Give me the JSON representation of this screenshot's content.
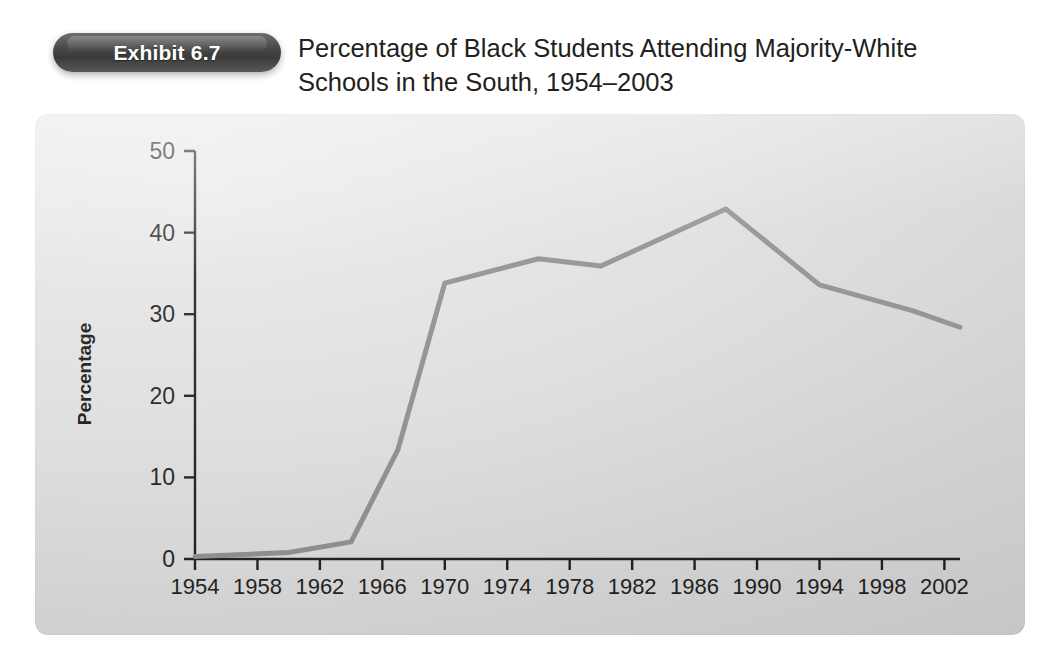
{
  "header": {
    "badge_label": "Exhibit 6.7",
    "title_line1": "Percentage of Black Students Attending Majority-White",
    "title_line2": "Schools in the South, 1954–2003"
  },
  "colors": {
    "badge_dark": "#3a3a3a",
    "badge_light": "#6e6e6e",
    "panel_background": "#dedede",
    "line_color": "#8c8c8c",
    "axis_color": "#1a1a1a",
    "text_color": "#231f20"
  },
  "chart_data": {
    "type": "line",
    "title": "Percentage of Black Students Attending Majority-White Schools in the South, 1954–2003",
    "xlabel": "",
    "ylabel": "Percentage",
    "xlim": [
      1954,
      2003
    ],
    "ylim": [
      0,
      50
    ],
    "yticks": [
      0,
      10,
      20,
      30,
      40,
      50
    ],
    "ytick_labels": [
      "0",
      "10",
      "20",
      "30",
      "40",
      "50"
    ],
    "xticks": [
      1954,
      1958,
      1962,
      1966,
      1970,
      1974,
      1978,
      1982,
      1986,
      1990,
      1994,
      1998,
      2002
    ],
    "xtick_labels": [
      "1954",
      "1958",
      "1962",
      "1966",
      "1970",
      "1974",
      "1978",
      "1982",
      "1986",
      "1990",
      "1994",
      "1998",
      "2002"
    ],
    "grid": false,
    "legend": false,
    "line_width": 5,
    "series": [
      {
        "name": "Percentage of Black students in majority-white schools",
        "x": [
          1954,
          1960,
          1964,
          1967,
          1970,
          1976,
          1980,
          1988,
          1994,
          2000,
          2003
        ],
        "values": [
          0.3,
          0.8,
          2.1,
          13.4,
          33.8,
          36.8,
          35.9,
          42.9,
          33.6,
          30.4,
          28.4
        ]
      }
    ]
  }
}
